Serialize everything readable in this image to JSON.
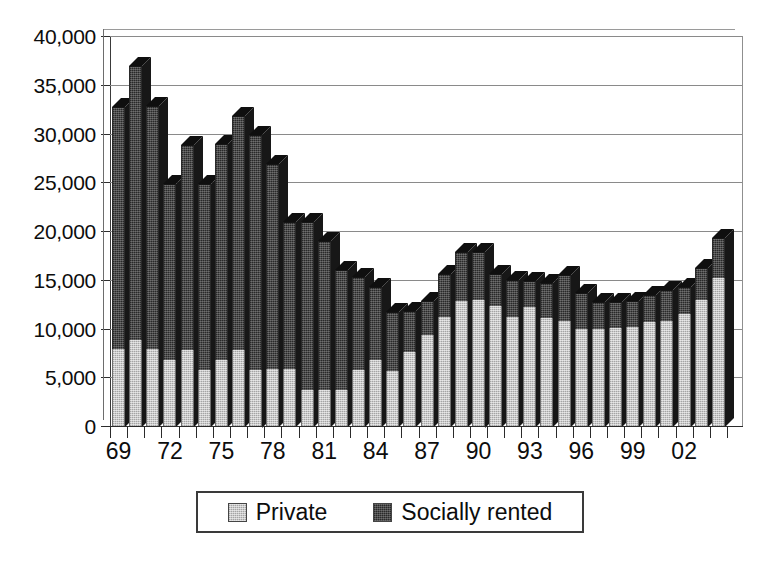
{
  "chart_data": {
    "type": "bar",
    "subtype": "stacked-column-3d",
    "title": "",
    "xlabel": "",
    "ylabel": "",
    "ylim": [
      0,
      40000
    ],
    "ytick_values": [
      0,
      5000,
      10000,
      15000,
      20000,
      25000,
      30000,
      35000,
      40000
    ],
    "ytick_labels": [
      "0",
      "5,000",
      "10,000",
      "15,000",
      "20,000",
      "25,000",
      "30,000",
      "35,000",
      "40,000"
    ],
    "grid": true,
    "legend_position": "bottom",
    "categories": [
      "69",
      "70",
      "71",
      "72",
      "73",
      "74",
      "75",
      "76",
      "77",
      "78",
      "79",
      "80",
      "81",
      "82",
      "83",
      "84",
      "85",
      "86",
      "87",
      "88",
      "89",
      "90",
      "91",
      "92",
      "93",
      "94",
      "95",
      "96",
      "97",
      "98",
      "99",
      "00",
      "01",
      "02",
      "03",
      "04"
    ],
    "xtick_labels_shown": [
      "69",
      "72",
      "75",
      "78",
      "81",
      "84",
      "87",
      "90",
      "93",
      "96",
      "99",
      "02"
    ],
    "series": [
      {
        "name": "Private",
        "color": "#c9c9c9",
        "values": [
          8000,
          8900,
          8000,
          6900,
          7900,
          5800,
          6900,
          7900,
          5800,
          6000,
          6000,
          3800,
          3800,
          3800,
          5800,
          6900,
          5700,
          7700,
          9400,
          11300,
          12900,
          13000,
          12400,
          11300,
          12300,
          11200,
          10900,
          10100,
          10100,
          10200,
          10300,
          10800,
          10900,
          11600,
          13000,
          15300
        ]
      },
      {
        "name": "Socially rented",
        "color": "#4a4a4a",
        "values": [
          24800,
          28100,
          24900,
          18000,
          21000,
          19100,
          22100,
          24000,
          24200,
          21000,
          15000,
          17200,
          15300,
          12300,
          9600,
          7500,
          6100,
          4200,
          3500,
          4400,
          5000,
          5000,
          3300,
          3800,
          2700,
          3600,
          4700,
          3600,
          2700,
          2600,
          2600,
          2700,
          3200,
          2800,
          3300,
          4100
        ]
      }
    ],
    "totals": [
      32800,
      37000,
      32900,
      24900,
      28900,
      24900,
      29000,
      31900,
      30000,
      27000,
      21000,
      21000,
      19100,
      16100,
      15400,
      14400,
      11800,
      11900,
      12900,
      15700,
      17900,
      18000,
      15700,
      15100,
      15000,
      14800,
      15600,
      13700,
      12800,
      12800,
      12900,
      13500,
      14100,
      14400,
      16300,
      19400
    ]
  },
  "legend": {
    "items": [
      {
        "label": "Private",
        "swatch": "private"
      },
      {
        "label": "Socially rented",
        "swatch": "social"
      }
    ]
  }
}
